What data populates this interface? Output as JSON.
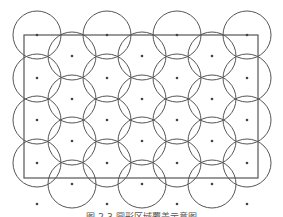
{
  "diagram": {
    "type": "circle-coverage-grid",
    "line_color": "#555555",
    "dot_color": "#444444",
    "circle_radius": 24,
    "boundary_rect": {
      "x": 24,
      "y": 35,
      "width": 234,
      "height": 143
    },
    "columns": [
      {
        "x": 37,
        "circle_rows": [
          35,
          78,
          120,
          163
        ],
        "extra_dots": [
          204
        ]
      },
      {
        "x": 72,
        "circle_rows": [
          56,
          99,
          141,
          184
        ],
        "extra_dots": []
      },
      {
        "x": 107,
        "circle_rows": [
          35,
          78,
          120,
          163
        ],
        "extra_dots": [
          204
        ]
      },
      {
        "x": 142,
        "circle_rows": [
          56,
          99,
          141,
          184
        ],
        "extra_dots": []
      },
      {
        "x": 177,
        "circle_rows": [
          35,
          78,
          120,
          163
        ],
        "extra_dots": [
          204
        ]
      },
      {
        "x": 212,
        "circle_rows": [
          56,
          99,
          141,
          184
        ],
        "extra_dots": []
      },
      {
        "x": 247,
        "circle_rows": [
          35,
          78,
          120,
          163
        ],
        "extra_dots": [
          204
        ]
      }
    ]
  },
  "caption": "图 2-3  圆形区域覆盖示意图"
}
